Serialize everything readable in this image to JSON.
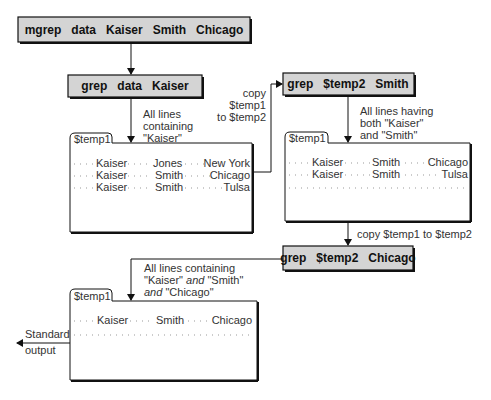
{
  "commands": {
    "mgrep": "mgrep   data   Kaiser   Smith   Chicago",
    "grep1": "grep   data   Kaiser",
    "grep2": "grep   $temp2   Smith",
    "grep3": "grep   $temp2   Chicago"
  },
  "labels": {
    "step1": [
      "All lines",
      "containing",
      "\"Kaiser\""
    ],
    "copy1": [
      "copy",
      "$temp1",
      "to $temp2"
    ],
    "step2": [
      "All lines having",
      "both \"Kaiser\"",
      "and \"Smith\""
    ],
    "copy2": "copy $temp1 to $temp2",
    "step3_line1": "All lines containing",
    "step3_line2a": "\"Kaiser\" ",
    "step3_line2b": "and",
    "step3_line2c": " \"Smith\"",
    "step3_line3a": "and",
    "step3_line3b": " \"Chicago\"",
    "stdout": [
      "Standard",
      "output"
    ]
  },
  "files": [
    {
      "name": "$temp1",
      "rows": [
        {
          "c1": "Kaiser",
          "c2": "Jones",
          "c3": "New York"
        },
        {
          "c1": "Kaiser",
          "c2": "Smith",
          "c3": "Chicago"
        },
        {
          "c1": "Kaiser",
          "c2": "Smith",
          "c3": "Tulsa"
        }
      ]
    },
    {
      "name": "$temp1",
      "rows": [
        {
          "c1": "Kaiser",
          "c2": "Smith",
          "c3": "Chicago"
        },
        {
          "c1": "Kaiser",
          "c2": "Smith",
          "c3": "Tulsa"
        }
      ]
    },
    {
      "name": "$temp1",
      "rows": [
        {
          "c1": "Kaiser",
          "c2": "Smith",
          "c3": "Chicago"
        }
      ]
    }
  ],
  "colors": {
    "box_fill": "#d4d4d4",
    "line": "#111111"
  }
}
